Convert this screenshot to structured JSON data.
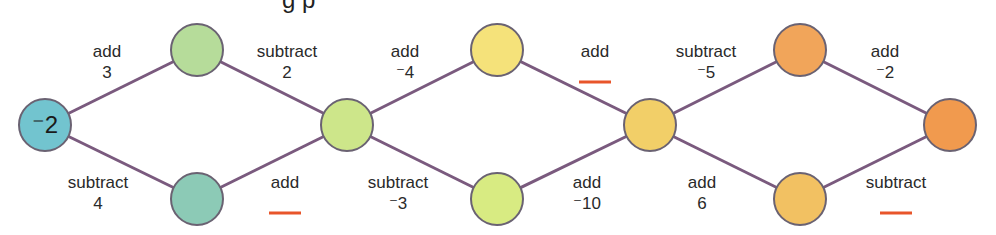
{
  "title_fragment": "g p",
  "colors": {
    "edge": "#7a5a7e",
    "node_stroke": "#6a6272",
    "blank": "#e8552a",
    "text": "#2a2a2a"
  },
  "nodes": [
    {
      "id": "n0",
      "x": 45,
      "y": 125,
      "value": "⁻2",
      "color": "#72c4cf"
    },
    {
      "id": "n1",
      "x": 197,
      "y": 50,
      "value": "",
      "color": "#b6dc9a"
    },
    {
      "id": "n2",
      "x": 197,
      "y": 199,
      "value": "",
      "color": "#8ccab6"
    },
    {
      "id": "n3",
      "x": 347,
      "y": 125,
      "value": "",
      "color": "#cde68a"
    },
    {
      "id": "n4",
      "x": 497,
      "y": 50,
      "value": "",
      "color": "#f5e27a"
    },
    {
      "id": "n5",
      "x": 497,
      "y": 199,
      "value": "",
      "color": "#d8eb82"
    },
    {
      "id": "n6",
      "x": 650,
      "y": 125,
      "value": "",
      "color": "#f2cf68"
    },
    {
      "id": "n7",
      "x": 800,
      "y": 50,
      "value": "",
      "color": "#f1a55a"
    },
    {
      "id": "n8",
      "x": 800,
      "y": 199,
      "value": "",
      "color": "#f2c162"
    },
    {
      "id": "n9",
      "x": 950,
      "y": 125,
      "value": "",
      "color": "#f19a4e"
    }
  ],
  "edges": [
    {
      "from": "n0",
      "to": "n1",
      "op": "add",
      "operand": "3",
      "blank": false,
      "lx": 107,
      "ly": 57
    },
    {
      "from": "n0",
      "to": "n2",
      "op": "subtract",
      "operand": "4",
      "blank": false,
      "lx": 98,
      "ly": 188
    },
    {
      "from": "n1",
      "to": "n3",
      "op": "subtract",
      "operand": "2",
      "blank": false,
      "lx": 287,
      "ly": 57
    },
    {
      "from": "n2",
      "to": "n3",
      "op": "add",
      "operand": "",
      "blank": true,
      "lx": 285,
      "ly": 188
    },
    {
      "from": "n3",
      "to": "n4",
      "op": "add",
      "operand": "⁻4",
      "blank": false,
      "lx": 405,
      "ly": 57
    },
    {
      "from": "n3",
      "to": "n5",
      "op": "subtract",
      "operand": "⁻3",
      "blank": false,
      "lx": 398,
      "ly": 188
    },
    {
      "from": "n4",
      "to": "n6",
      "op": "add",
      "operand": "",
      "blank": true,
      "lx": 595,
      "ly": 57
    },
    {
      "from": "n5",
      "to": "n6",
      "op": "add",
      "operand": "⁻10",
      "blank": false,
      "lx": 587,
      "ly": 188
    },
    {
      "from": "n6",
      "to": "n7",
      "op": "subtract",
      "operand": "⁻5",
      "blank": false,
      "lx": 706,
      "ly": 57
    },
    {
      "from": "n6",
      "to": "n8",
      "op": "add",
      "operand": "6",
      "blank": false,
      "lx": 702,
      "ly": 188
    },
    {
      "from": "n7",
      "to": "n9",
      "op": "add",
      "operand": "⁻2",
      "blank": false,
      "lx": 885,
      "ly": 57
    },
    {
      "from": "n8",
      "to": "n9",
      "op": "subtract",
      "operand": "",
      "blank": true,
      "lx": 896,
      "ly": 188
    }
  ]
}
